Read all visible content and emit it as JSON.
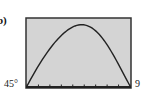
{
  "figure": {
    "label": "b)"
  },
  "chart_data": {
    "type": "line",
    "title": "",
    "xlabel": "",
    "ylabel": "",
    "x_tick_labels": [
      "45°",
      "90°"
    ],
    "xlim": [
      45,
      90
    ],
    "x_ticks_count": 9,
    "x": [
      45,
      50,
      55,
      60,
      65,
      67.5,
      70,
      75,
      80,
      85,
      90
    ],
    "values": [
      0,
      0.5,
      0.82,
      0.97,
      1.0,
      1.0,
      0.99,
      0.9,
      0.7,
      0.38,
      0
    ],
    "series": [
      {
        "name": "curve",
        "color": "#222222"
      }
    ],
    "grid": false,
    "legend": null,
    "background_color": "#d4d4d4",
    "frame_color": "#222222"
  },
  "axis": {
    "left_label": "45°",
    "right_label": "9"
  }
}
